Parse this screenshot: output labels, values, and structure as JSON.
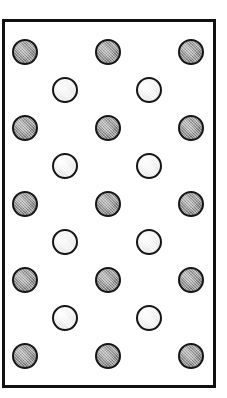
{
  "figure": {
    "title": "",
    "caption": "",
    "canvas_width": 227,
    "canvas_height": 398
  },
  "cell": {
    "name": "unit-cell-box",
    "x": 2,
    "y": 19,
    "width": 214,
    "height": 369,
    "border_width": 3,
    "border_color": "#111111",
    "fill_color": "#ffffff"
  },
  "legend": {
    "type_a_label": "",
    "type_b_label": ""
  },
  "colors": {
    "gray_fill": "#9a9a9a",
    "white_fill": "#f2f2f2",
    "outline": "#151515",
    "frame": "#111111",
    "background": "#ffffff"
  },
  "chart_data": {
    "type": "scatter",
    "title": "",
    "subtitle": "",
    "xlabel": "",
    "ylabel": "",
    "xlim": [
      0,
      227
    ],
    "ylim": [
      398,
      0
    ],
    "grid": false,
    "legend_position": "none",
    "annotations": [],
    "marker_radius": 13,
    "rows": [
      {
        "row": 1,
        "kind": "gray",
        "y": 52,
        "x": [
          25,
          108,
          191
        ]
      },
      {
        "row": 2,
        "kind": "white",
        "y": 90,
        "x": [
          65,
          149
        ]
      },
      {
        "row": 3,
        "kind": "gray",
        "y": 128,
        "x": [
          25,
          108,
          191
        ]
      },
      {
        "row": 4,
        "kind": "white",
        "y": 166,
        "x": [
          65,
          149
        ]
      },
      {
        "row": 5,
        "kind": "gray",
        "y": 204,
        "x": [
          25,
          108,
          191
        ]
      },
      {
        "row": 6,
        "kind": "white",
        "y": 242,
        "x": [
          65,
          149
        ]
      },
      {
        "row": 7,
        "kind": "gray",
        "y": 280,
        "x": [
          25,
          108,
          191
        ]
      },
      {
        "row": 8,
        "kind": "white",
        "y": 318,
        "x": [
          65,
          149
        ]
      },
      {
        "row": 9,
        "kind": "gray",
        "y": 356,
        "x": [
          25,
          108,
          191
        ]
      }
    ],
    "series": [
      {
        "name": "gray",
        "fill": "#9a9a9a",
        "count": 15,
        "points": [
          {
            "x": 25,
            "y": 52
          },
          {
            "x": 108,
            "y": 52
          },
          {
            "x": 191,
            "y": 52
          },
          {
            "x": 25,
            "y": 128
          },
          {
            "x": 108,
            "y": 128
          },
          {
            "x": 191,
            "y": 128
          },
          {
            "x": 25,
            "y": 204
          },
          {
            "x": 108,
            "y": 204
          },
          {
            "x": 191,
            "y": 204
          },
          {
            "x": 25,
            "y": 280
          },
          {
            "x": 108,
            "y": 280
          },
          {
            "x": 191,
            "y": 280
          },
          {
            "x": 25,
            "y": 356
          },
          {
            "x": 108,
            "y": 356
          },
          {
            "x": 191,
            "y": 356
          }
        ]
      },
      {
        "name": "white",
        "fill": "#f2f2f2",
        "count": 8,
        "points": [
          {
            "x": 65,
            "y": 90
          },
          {
            "x": 149,
            "y": 90
          },
          {
            "x": 65,
            "y": 166
          },
          {
            "x": 149,
            "y": 166
          },
          {
            "x": 65,
            "y": 242
          },
          {
            "x": 149,
            "y": 242
          },
          {
            "x": 65,
            "y": 318
          },
          {
            "x": 149,
            "y": 318
          }
        ]
      }
    ],
    "totals": {
      "gray_count": 15,
      "white_count": 8,
      "total_count": 23,
      "gray_rows": 5,
      "white_rows": 4,
      "gray_per_row": 3,
      "white_per_row": 2
    }
  }
}
